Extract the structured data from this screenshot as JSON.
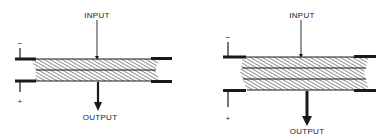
{
  "diagrams": [
    {
      "id": "single-layer",
      "labels": {
        "input": "INPUT",
        "output": "OUTPUT",
        "minus": "−",
        "plus": "+"
      },
      "layers": 2
    },
    {
      "id": "double-layer",
      "labels": {
        "input": "INPUT",
        "output": "OUTPUT",
        "minus": "−",
        "plus": "+"
      },
      "layers": 3
    }
  ],
  "colors": {
    "ink": "#1a1a1a",
    "hatch": "#6a6a6a",
    "background": "#ffffff"
  }
}
